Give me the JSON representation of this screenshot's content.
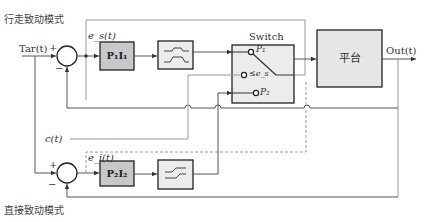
{
  "diagram": {
    "upper_mode_label": "行走致动模式",
    "lower_mode_label": "直接致动模式",
    "input_label": "Tar(t)",
    "output_label": "Out(t)",
    "upper_error_label": "e_s(t)",
    "lower_error_label": "e_i(t)",
    "disturbance_label": "c(t)",
    "plus_sign": "+",
    "minus_sign": "−",
    "blocks": {
      "controller1": "P₁I₁",
      "controller2": "P₂I₂",
      "saturation1": "saturation-step-icon",
      "saturation2": "saturation-ramp-icon",
      "switch_title": "Switch",
      "switch_p1": "P₁",
      "switch_cond": "≤e_s",
      "switch_p2": "P₂",
      "platform": "平台"
    },
    "colors": {
      "line": "#555555",
      "light_line": "#999999",
      "block_fill_dark": "#c8c8c8",
      "block_fill_light": "#ececec",
      "block_border": "#222222"
    }
  }
}
